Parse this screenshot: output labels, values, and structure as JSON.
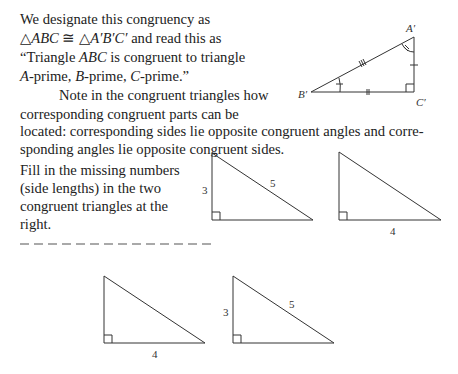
{
  "paragraph1": {
    "line1": "We designate this congruency as",
    "line2_a": "△",
    "line2_b": "ABC",
    "line2_c": " ≅ △",
    "line2_d": "A′B′C′",
    "line2_e": " and read this as",
    "line3_a": "“Triangle ",
    "line3_b": "ABC",
    "line3_c": " is congruent to triangle",
    "line4_a": "A",
    "line4_b": "-prime, ",
    "line4_c": "B",
    "line4_d": "-prime, ",
    "line4_e": "C",
    "line4_f": "-prime.”"
  },
  "paragraph2": {
    "line1": "Note in the congruent triangles how",
    "line2": "corresponding congruent parts can be",
    "line3": "located:  corresponding sides lie opposite congruent angles and corre-",
    "line4": "sponding angles lie opposite congruent sides."
  },
  "exercise": {
    "line1": "Fill in the missing numbers",
    "line2": "(side lengths) in the two",
    "line3": "congruent triangles at the",
    "line4": "right."
  },
  "figure_top": {
    "vertex_a": "A′",
    "vertex_b": "B′",
    "vertex_c": "C′"
  },
  "triangles": [
    {
      "leg_vertical": "3",
      "hypotenuse": "5",
      "leg_horizontal": ""
    },
    {
      "leg_vertical": "",
      "hypotenuse": "",
      "leg_horizontal": "4"
    },
    {
      "leg_vertical": "",
      "hypotenuse": "",
      "leg_horizontal": "4"
    },
    {
      "leg_vertical": "3",
      "hypotenuse": "5",
      "leg_horizontal": ""
    }
  ]
}
